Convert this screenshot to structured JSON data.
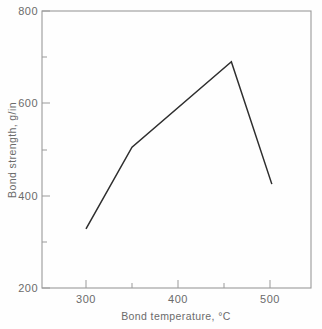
{
  "chart_data": {
    "type": "line",
    "title": "",
    "xlabel": "Bond temperature, °C",
    "ylabel": "Bond strength, g/in",
    "xlim": [
      275,
      520
    ],
    "ylim": [
      200,
      800
    ],
    "grid": false,
    "legend": "none",
    "x_major_ticks": [
      300,
      400,
      500
    ],
    "x_major_tick_labels": [
      "300",
      "400",
      "500"
    ],
    "x_minor_ticks": [
      350,
      450
    ],
    "y_major_ticks": [
      200,
      400,
      600,
      800
    ],
    "y_major_tick_labels": [
      "200",
      "400",
      "600",
      "800"
    ],
    "y_minor_ticks": [
      300,
      500,
      700
    ],
    "x": [
      300,
      350,
      458,
      502
    ],
    "values": [
      328,
      505,
      690,
      425
    ],
    "series": [
      {
        "name": "Bond strength",
        "color": "#2e2e2e",
        "points": [
          {
            "x": 300,
            "y": 328
          },
          {
            "x": 350,
            "y": 505
          },
          {
            "x": 458,
            "y": 690
          },
          {
            "x": 502,
            "y": 425
          }
        ]
      }
    ]
  },
  "axes": {
    "x_title": "Bond temperature, °C",
    "y_title": "Bond strength, g/in",
    "x_labels": [
      "300",
      "400",
      "500"
    ],
    "y_labels": [
      "800",
      "600",
      "400",
      "200"
    ]
  },
  "colors": {
    "line": "#2e2e2e",
    "frame": "#9a9a9a",
    "text": "#6b6b6b",
    "background": "#fefefe"
  }
}
